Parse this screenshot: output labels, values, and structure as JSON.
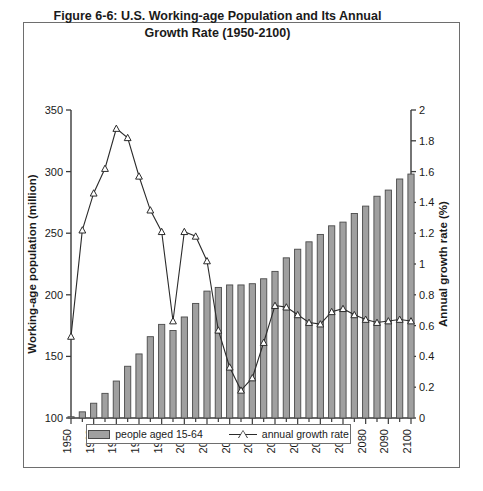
{
  "figure": {
    "title_line1": "Figure 6-6: U.S. Working-age Population and Its Annual",
    "title_line2": "Growth Rate (1950-2100)"
  },
  "legend": {
    "bar_label": "people aged 15-64",
    "line_label": "annual growth rate"
  },
  "axes": {
    "left_label": "Working-age population (million)",
    "right_label": "Annual growth rate (%)"
  },
  "colors": {
    "bar_fill": "#a0a0a0",
    "bar_stroke": "#4a4a4a",
    "line_stroke": "#2b2b2b",
    "axis": "#3a3a3a",
    "frame": "#6e6e6e",
    "text": "#1a1a1a"
  },
  "chart_data": {
    "type": "bar",
    "title": "Figure 6-6: U.S. Working-age Population and Its Annual Growth Rate (1950-2100)",
    "xlabel": "",
    "ylabel": "Working-age population (million)",
    "y2label": "Annual growth rate (%)",
    "ylim": [
      100,
      350
    ],
    "y2lim": [
      0,
      2
    ],
    "yticks": [
      100,
      150,
      200,
      250,
      300,
      350
    ],
    "y2ticks": [
      0,
      0.2,
      0.4,
      0.6,
      0.8,
      1,
      1.2,
      1.4,
      1.6,
      1.8,
      2
    ],
    "xlim": [
      1950,
      2100
    ],
    "xticks": [
      1950,
      1960,
      1970,
      1980,
      1990,
      2000,
      2010,
      2020,
      2030,
      2040,
      2050,
      2060,
      2070,
      2080,
      2090,
      2100
    ],
    "xtick_labels": [
      "1950",
      "1960",
      "1970",
      "1980",
      "1990",
      "2000",
      "2010",
      "2020",
      "2030",
      "2040",
      "2050",
      "2060",
      "2070",
      "2080",
      "2090",
      "2100"
    ],
    "minor_xtick_interval": 5,
    "grid": false,
    "legend_position": "bottom",
    "x": [
      1950,
      1955,
      1960,
      1965,
      1970,
      1975,
      1980,
      1985,
      1990,
      1995,
      2000,
      2005,
      2010,
      2015,
      2020,
      2025,
      2030,
      2035,
      2040,
      2045,
      2050,
      2055,
      2060,
      2065,
      2070,
      2075,
      2080,
      2085,
      2090,
      2095,
      2100
    ],
    "series": [
      {
        "name": "people aged 15-64",
        "type": "bar",
        "axis": "left",
        "unit": "million",
        "values": [
          101,
          105,
          112,
          120,
          130,
          142,
          152,
          166,
          176,
          171,
          182,
          193,
          203,
          206,
          208,
          208,
          209,
          213,
          219,
          230,
          237,
          243,
          249,
          256,
          259,
          266,
          272,
          280,
          285,
          294,
          298
        ]
      },
      {
        "name": "annual growth rate",
        "type": "line",
        "axis": "right",
        "unit": "%",
        "marker": "triangle",
        "values": [
          0.53,
          1.22,
          1.46,
          1.62,
          1.88,
          1.82,
          1.57,
          1.35,
          1.21,
          0.63,
          1.21,
          1.18,
          1.02,
          0.57,
          0.33,
          0.18,
          0.26,
          0.49,
          0.73,
          0.72,
          0.67,
          0.62,
          0.61,
          0.69,
          0.71,
          0.67,
          0.64,
          0.62,
          0.63,
          0.64,
          0.63
        ]
      }
    ]
  }
}
